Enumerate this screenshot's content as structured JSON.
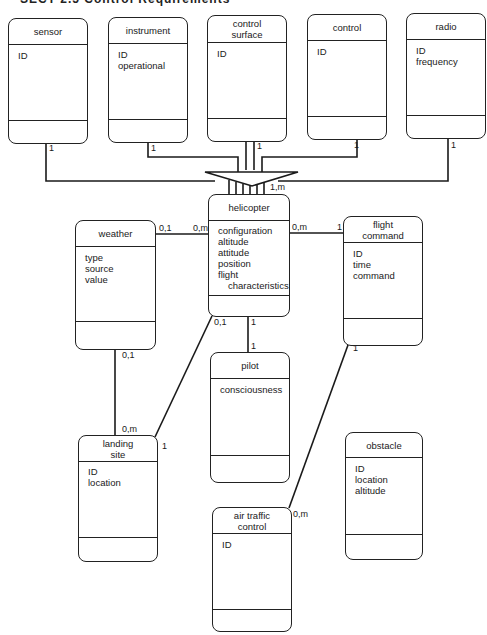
{
  "page_header": "SECT 2.5  Control Requirements",
  "entities": {
    "sensor": {
      "title": "sensor",
      "attributes": [
        "ID"
      ]
    },
    "instrument": {
      "title": "instrument",
      "attributes": [
        "ID",
        "operational"
      ]
    },
    "control_surface": {
      "title": "control surface",
      "title_lines": [
        "control",
        "surface"
      ],
      "attributes": [
        "ID"
      ]
    },
    "control": {
      "title": "control",
      "attributes": [
        "ID"
      ]
    },
    "radio": {
      "title": "radio",
      "attributes": [
        "ID",
        "frequency"
      ]
    },
    "helicopter": {
      "title": "helicopter",
      "attributes": [
        "configuration",
        "altitude",
        "attitude",
        "position",
        "flight",
        "characteristics"
      ]
    },
    "weather": {
      "title": "weather",
      "attributes": [
        "type",
        "source",
        "value"
      ]
    },
    "flight_command": {
      "title": "flight command",
      "title_lines": [
        "flight",
        "command"
      ],
      "attributes": [
        "ID",
        "time",
        "command"
      ]
    },
    "pilot": {
      "title": "pilot",
      "attributes": [
        "consciousness"
      ]
    },
    "landing_site": {
      "title": "landing site",
      "title_lines": [
        "landing",
        "site"
      ],
      "attributes": [
        "ID",
        "location"
      ]
    },
    "obstacle": {
      "title": "obstacle",
      "attributes": [
        "ID",
        "location",
        "altitude"
      ]
    },
    "air_traffic_control": {
      "title": "air traffic control",
      "title_lines": [
        "air traffic",
        "control"
      ],
      "attributes": [
        "ID"
      ]
    }
  },
  "relationships": {
    "sensor_helicopter": {
      "from": "sensor",
      "to": "helicopter",
      "from_card": "1",
      "type": "aggregation"
    },
    "instrument_helicopter": {
      "from": "instrument",
      "to": "helicopter",
      "from_card": "1",
      "type": "aggregation"
    },
    "control_surface_helicopter": {
      "from": "control surface",
      "to": "helicopter",
      "from_card": "1",
      "type": "aggregation"
    },
    "control_helicopter": {
      "from": "control",
      "to": "helicopter",
      "from_card": "1",
      "type": "aggregation"
    },
    "radio_helicopter": {
      "from": "radio",
      "to": "helicopter",
      "from_card": "1",
      "type": "aggregation"
    },
    "aggregation_helicopter_card": "1,m",
    "weather_helicopter": {
      "weather_card": "0,1",
      "helicopter_card": "0,m"
    },
    "helicopter_flight_command": {
      "helicopter_card": "0,m",
      "flight_command_card": "1"
    },
    "helicopter_pilot": {
      "helicopter_card": "1",
      "pilot_card": "1"
    },
    "helicopter_landing_site": {
      "helicopter_card": "0,1",
      "landing_site_card": "1"
    },
    "weather_landing_site": {
      "weather_card": "0,1",
      "landing_site_card": "0,m"
    },
    "flight_command_air_traffic_control": {
      "flight_command_card": "1",
      "air_traffic_control_card": "0,m"
    }
  }
}
